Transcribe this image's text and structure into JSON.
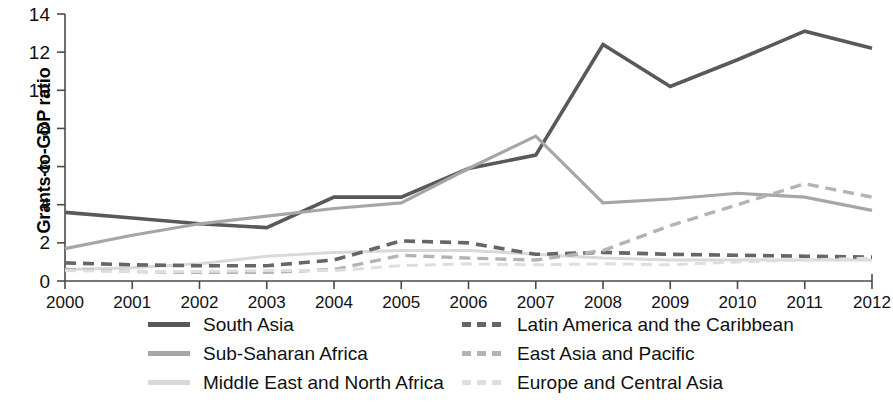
{
  "chart_data": {
    "type": "line",
    "title": "",
    "xlabel": "",
    "ylabel": "Grants-to-GDP ratio",
    "categories": [
      "2000",
      "2001",
      "2002",
      "2003",
      "2004",
      "2005",
      "2006",
      "2007",
      "2008",
      "2009",
      "2010",
      "2011",
      "2012"
    ],
    "x": [
      2000,
      2001,
      2002,
      2003,
      2004,
      2005,
      2006,
      2007,
      2008,
      2009,
      2010,
      2011,
      2012
    ],
    "xlim": [
      2000,
      2012
    ],
    "ylim": [
      0,
      14
    ],
    "yticks": [
      0,
      2,
      4,
      6,
      8,
      10,
      12,
      14
    ],
    "ytick_labels": [
      "0",
      "2",
      "4",
      "6",
      "8",
      "10",
      "12",
      "14"
    ],
    "xtick_labels": [
      "2000",
      "2001",
      "2002",
      "2003",
      "2004",
      "2005",
      "2006",
      "2007",
      "2008",
      "2009",
      "2010",
      "2011",
      "2012"
    ],
    "grid": false,
    "legend_position": "below",
    "series": [
      {
        "name": "South Asia",
        "color": "#595959",
        "dash": "solid",
        "width": 3.6,
        "values": [
          3.6,
          3.3,
          3.0,
          2.8,
          4.4,
          4.4,
          5.9,
          6.6,
          12.4,
          10.2,
          11.6,
          13.1,
          12.2
        ]
      },
      {
        "name": "Sub-Saharan Africa",
        "color": "#a6a6a6",
        "dash": "solid",
        "width": 3.2,
        "values": [
          1.7,
          2.4,
          3.0,
          3.4,
          3.8,
          4.1,
          5.9,
          7.6,
          4.1,
          4.3,
          4.6,
          4.4,
          3.7
        ]
      },
      {
        "name": "Middle East and North Africa",
        "color": "#d9d9d9",
        "dash": "solid",
        "width": 3.0,
        "values": [
          0.6,
          0.7,
          0.9,
          1.3,
          1.5,
          1.6,
          1.6,
          1.4,
          1.2,
          1.1,
          1.1,
          1.1,
          1.1
        ]
      },
      {
        "name": "Latin America and the Caribbean",
        "color": "#666666",
        "dash": "dashed",
        "width": 3.6,
        "values": [
          0.95,
          0.85,
          0.8,
          0.8,
          1.1,
          2.1,
          2.0,
          1.4,
          1.5,
          1.4,
          1.35,
          1.3,
          1.25
        ]
      },
      {
        "name": "East Asia and Pacific",
        "color": "#b3b3b3",
        "dash": "dashed",
        "width": 3.4,
        "values": [
          0.6,
          0.5,
          0.45,
          0.45,
          0.6,
          1.35,
          1.2,
          1.1,
          1.6,
          2.9,
          4.0,
          5.1,
          4.4
        ]
      },
      {
        "name": "Europe and Central Asia",
        "color": "#dedede",
        "dash": "dashed",
        "width": 3.0,
        "values": [
          0.55,
          0.5,
          0.5,
          0.55,
          0.55,
          0.8,
          0.9,
          0.85,
          0.9,
          0.85,
          1.0,
          1.1,
          1.2
        ]
      }
    ]
  },
  "axes": {
    "ylabel_text": "Grants-to-GDP ratio"
  },
  "legend": {
    "left_column": [
      {
        "label": "South Asia",
        "color": "#595959",
        "dash": "solid"
      },
      {
        "label": "Sub-Saharan Africa",
        "color": "#a6a6a6",
        "dash": "solid"
      },
      {
        "label": "Middle East and North Africa",
        "color": "#d9d9d9",
        "dash": "solid"
      }
    ],
    "right_column": [
      {
        "label": "Latin America and the Caribbean",
        "color": "#666666",
        "dash": "dashed"
      },
      {
        "label": "East Asia and Pacific",
        "color": "#b3b3b3",
        "dash": "dashed"
      },
      {
        "label": "Europe and Central Asia",
        "color": "#dedede",
        "dash": "dashed"
      }
    ]
  }
}
